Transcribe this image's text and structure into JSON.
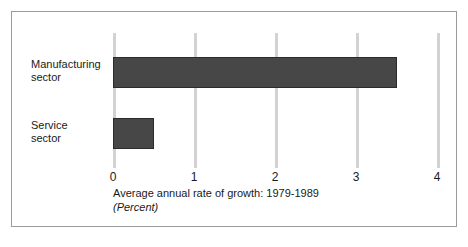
{
  "chart_data": {
    "type": "bar",
    "orientation": "horizontal",
    "title": "",
    "subtitle": "",
    "categories": [
      "Manufacturing sector",
      "Service sector"
    ],
    "category_lines": [
      [
        "Manufacturing",
        "sector"
      ],
      [
        "Service",
        "sector"
      ]
    ],
    "values": [
      3.5,
      0.5
    ],
    "xlabel": "Average annual rate of growth: 1979-1989",
    "xunit": "(Percent)",
    "ylabel": "",
    "xlim": [
      0,
      4
    ],
    "xticks": [
      0,
      1,
      2,
      3,
      4
    ],
    "xtick_labels": [
      "0",
      "1",
      "2",
      "3",
      "4"
    ],
    "grid": true,
    "grid_axis": "x",
    "legend": false,
    "legend_position": "none",
    "colors": {
      "bar_fill": "#474747",
      "bar_stroke": "#2b2b2b",
      "gridline": "#d2d2d2",
      "frame": "#9a9a9a",
      "text": "#1a1a1a",
      "background": "#ffffff"
    }
  },
  "axis": {
    "caption": "Average annual rate of growth: 1979-1989",
    "unit": "(Percent)"
  },
  "ticks": {
    "t0": "0",
    "t1": "1",
    "t2": "2",
    "t3": "3",
    "t4": "4"
  },
  "categories": {
    "manufacturing_line1": "Manufacturing",
    "manufacturing_line2": "sector",
    "service_line1": "Service",
    "service_line2": "sector"
  }
}
